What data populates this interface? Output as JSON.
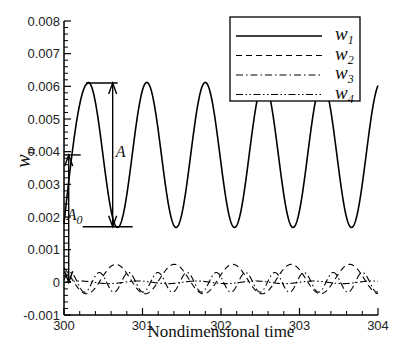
{
  "chart_data": {
    "type": "line",
    "title": "",
    "xlabel": "Nondimensional time",
    "ylabel": "w",
    "ylabel_sub": "n",
    "xlim": [
      300,
      304
    ],
    "ylim": [
      -0.001,
      0.008
    ],
    "xticks": [
      300,
      301,
      302,
      303,
      304
    ],
    "xtick_labels": [
      "300",
      "301",
      "302",
      "303",
      "304"
    ],
    "yticks": [
      -0.001,
      0,
      0.001,
      0.002,
      0.003,
      0.004,
      0.005,
      0.006,
      0.007,
      0.008
    ],
    "ytick_labels": [
      "-0.001",
      "0",
      "0.001",
      "0.002",
      "0.003",
      "0.004",
      "0.005",
      "0.006",
      "0.007",
      "0.008"
    ],
    "grid": false,
    "legend_position": "top-right",
    "series": [
      {
        "name": "w",
        "sub": "1",
        "style": "solid",
        "model": {
          "mean": 0.0039,
          "amplitude": 0.00222,
          "period": 0.745,
          "phase_peak_t": 300.31
        }
      },
      {
        "name": "w",
        "sub": "2",
        "style": "dashed",
        "model": {
          "mean": 0.0001,
          "amplitude": 0.00045,
          "period": 0.745,
          "phase_peak_t": 300.66
        }
      },
      {
        "name": "w",
        "sub": "3",
        "style": "dashdot",
        "model": {
          "mean": 0.0,
          "amplitude": 0.0003,
          "period": 0.3725,
          "phase_peak_t": 300.45
        }
      },
      {
        "name": "w",
        "sub": "4",
        "style": "dashdotdot",
        "model": {
          "mean": 0.0,
          "amplitude": 4e-05,
          "period": 0.745,
          "phase_peak_t": 300.2
        }
      }
    ],
    "annotations": [
      {
        "label": "A",
        "sub": "",
        "description": "peak-to-trough amplitude of w1",
        "from_y": 0.0061,
        "to_y": 0.0017,
        "x": 300.62
      },
      {
        "label": "A",
        "sub": "0",
        "description": "mean offset of w1",
        "from_y": 0.0039,
        "to_y": 0.0,
        "x": 300.06
      }
    ]
  }
}
